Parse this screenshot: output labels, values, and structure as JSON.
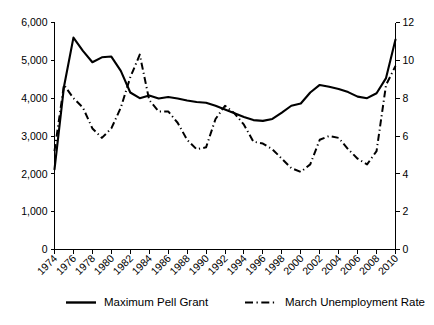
{
  "chart_data": {
    "type": "line",
    "title": "",
    "subtitle": "",
    "xlabel": "",
    "ylabel": "",
    "y2label": "",
    "grid": false,
    "legend_position": "bottom",
    "x": [
      1974,
      1975,
      1976,
      1977,
      1978,
      1979,
      1980,
      1981,
      1982,
      1983,
      1984,
      1985,
      1986,
      1987,
      1988,
      1989,
      1990,
      1991,
      1992,
      1993,
      1994,
      1995,
      1996,
      1997,
      1998,
      1999,
      2000,
      2001,
      2002,
      2003,
      2004,
      2005,
      2006,
      2007,
      2008,
      2009,
      2010
    ],
    "xlim": [
      1974,
      2010
    ],
    "xticks": [
      1974,
      1976,
      1978,
      1980,
      1982,
      1984,
      1986,
      1988,
      1990,
      1992,
      1994,
      1996,
      1998,
      2000,
      2002,
      2004,
      2006,
      2008,
      2010
    ],
    "xticklabels": [
      "1974",
      "1976",
      "1978",
      "1980",
      "1982",
      "1984",
      "1986",
      "1988",
      "1990",
      "1992",
      "1994",
      "1996",
      "1998",
      "2000",
      "2002",
      "2004",
      "2006",
      "2008",
      "2010"
    ],
    "ylim": [
      0,
      6000
    ],
    "yticks": [
      0,
      1000,
      2000,
      3000,
      4000,
      5000,
      6000
    ],
    "yticklabels": [
      "0",
      "1,000",
      "2,000",
      "3,000",
      "4,000",
      "5,000",
      "6,000"
    ],
    "y2lim": [
      0,
      12
    ],
    "y2ticks": [
      0,
      2,
      4,
      6,
      8,
      10,
      12
    ],
    "y2ticklabels": [
      "0",
      "2",
      "4",
      "6",
      "8",
      "10",
      "12"
    ],
    "series": [
      {
        "name": "Maximum Pell Grant",
        "axis": "left",
        "style": "solid",
        "color": "#000000",
        "values": [
          2120,
          4300,
          5600,
          5250,
          4950,
          5080,
          5100,
          4720,
          4150,
          4000,
          4070,
          3990,
          4030,
          3990,
          3940,
          3900,
          3880,
          3800,
          3700,
          3600,
          3500,
          3420,
          3400,
          3450,
          3620,
          3800,
          3860,
          4150,
          4350,
          4300,
          4240,
          4160,
          4040,
          4000,
          4130,
          4530,
          5550
        ]
      },
      {
        "name": "March Unemployment Rate",
        "axis": "right",
        "style": "dash-dot",
        "color": "#000000",
        "values": [
          5.2,
          8.7,
          8.0,
          7.5,
          6.4,
          5.9,
          6.4,
          7.5,
          9.1,
          10.3,
          7.9,
          7.3,
          7.3,
          6.7,
          5.8,
          5.3,
          5.4,
          6.9,
          7.6,
          7.2,
          6.6,
          5.7,
          5.6,
          5.3,
          4.8,
          4.3,
          4.1,
          4.5,
          5.8,
          6.0,
          5.9,
          5.3,
          4.8,
          4.5,
          5.2,
          8.7,
          9.7
        ]
      }
    ]
  },
  "legend": {
    "items": [
      {
        "label": "Maximum Pell Grant",
        "style": "solid"
      },
      {
        "label": "March Unemployment Rate",
        "style": "dash-dot"
      }
    ]
  }
}
